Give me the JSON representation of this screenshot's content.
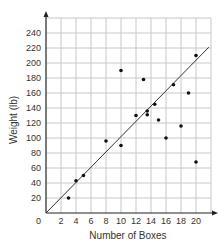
{
  "chart_data": {
    "type": "scatter",
    "title": "",
    "xlabel": "Number of Boxes",
    "ylabel": "Weight (lb)",
    "xlim": [
      0,
      22
    ],
    "ylim": [
      0,
      260
    ],
    "grid": true,
    "legend": null,
    "origin_label": "0",
    "x_ticks": [
      2,
      4,
      6,
      8,
      10,
      12,
      14,
      16,
      18,
      20
    ],
    "y_ticks": [
      20,
      40,
      60,
      80,
      100,
      120,
      140,
      160,
      180,
      200,
      220,
      240
    ],
    "points": [
      {
        "x": 3,
        "y": 20
      },
      {
        "x": 4,
        "y": 43
      },
      {
        "x": 5,
        "y": 50
      },
      {
        "x": 8,
        "y": 96
      },
      {
        "x": 10,
        "y": 90
      },
      {
        "x": 10,
        "y": 190
      },
      {
        "x": 12,
        "y": 130
      },
      {
        "x": 13,
        "y": 178
      },
      {
        "x": 13.5,
        "y": 136
      },
      {
        "x": 13.5,
        "y": 131
      },
      {
        "x": 14.5,
        "y": 145
      },
      {
        "x": 15,
        "y": 124
      },
      {
        "x": 16,
        "y": 100
      },
      {
        "x": 17,
        "y": 171
      },
      {
        "x": 18,
        "y": 116
      },
      {
        "x": 19,
        "y": 160
      },
      {
        "x": 20,
        "y": 210
      },
      {
        "x": 20,
        "y": 68
      }
    ],
    "trend_line": {
      "x0": 0,
      "y0": 0,
      "x1": 21.7,
      "y1": 221
    }
  },
  "colors": {
    "grid": "#c8c8c8",
    "axis": "#222222",
    "point": "#111111",
    "line": "#333333"
  }
}
